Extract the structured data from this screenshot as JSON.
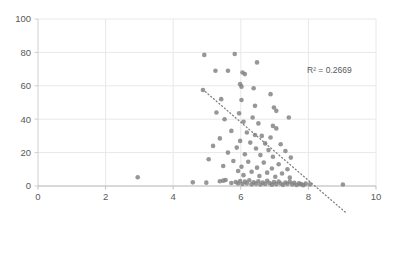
{
  "chart_data": {
    "type": "scatter",
    "title": "",
    "subtitle": "",
    "xlabel": "",
    "ylabel": "",
    "xlim": [
      0,
      10
    ],
    "ylim": [
      0,
      100
    ],
    "xticks": [
      0,
      2,
      4,
      6,
      8,
      10
    ],
    "yticks": [
      0,
      20,
      40,
      60,
      80,
      100
    ],
    "xtick_labels": [
      "0",
      "2",
      "4",
      "6",
      "8",
      "10"
    ],
    "ytick_labels": [
      "0",
      "20",
      "40",
      "60",
      "80",
      "100"
    ],
    "grid": true,
    "grid_color": "#e8e8e8",
    "legend": null,
    "legend_position": "none",
    "marker_color": "#808080",
    "marker_size": 4.6,
    "marker_shape": "circle",
    "annotations": [
      {
        "name": "r-squared-label",
        "text": "R² = 0.2669",
        "x": 8.62,
        "y": 67.5
      }
    ],
    "trendline": {
      "type": "linear-dotted",
      "color": "#808080",
      "x_start": 4.95,
      "y_start": 56.5,
      "x_end": 9.1,
      "y_end": -15.8
    },
    "series": [
      {
        "name": "observations",
        "color": "#808080",
        "points": [
          [
            4.92,
            78.5
          ],
          [
            5.82,
            79.0
          ],
          [
            5.25,
            69.0
          ],
          [
            5.62,
            69.0
          ],
          [
            6.05,
            68.0
          ],
          [
            6.12,
            67.0
          ],
          [
            6.48,
            74.0
          ],
          [
            5.98,
            61.0
          ],
          [
            6.02,
            59.5
          ],
          [
            6.38,
            58.5
          ],
          [
            4.88,
            57.5
          ],
          [
            5.42,
            52.0
          ],
          [
            6.02,
            51.5
          ],
          [
            6.88,
            55.0
          ],
          [
            6.42,
            48.0
          ],
          [
            6.98,
            47.0
          ],
          [
            7.05,
            45.0
          ],
          [
            5.28,
            44.0
          ],
          [
            5.95,
            43.5
          ],
          [
            6.35,
            41.0
          ],
          [
            7.42,
            41.0
          ],
          [
            5.52,
            40.0
          ],
          [
            6.08,
            38.5
          ],
          [
            6.52,
            37.5
          ],
          [
            6.95,
            36.0
          ],
          [
            7.05,
            34.5
          ],
          [
            5.72,
            33.0
          ],
          [
            6.18,
            32.0
          ],
          [
            6.42,
            30.5
          ],
          [
            6.62,
            30.0
          ],
          [
            6.88,
            29.0
          ],
          [
            5.38,
            28.5
          ],
          [
            5.98,
            27.0
          ],
          [
            6.28,
            26.0
          ],
          [
            6.72,
            25.5
          ],
          [
            7.18,
            25.0
          ],
          [
            5.18,
            24.0
          ],
          [
            5.88,
            23.0
          ],
          [
            6.45,
            22.5
          ],
          [
            6.82,
            21.5
          ],
          [
            7.32,
            21.0
          ],
          [
            5.62,
            20.0
          ],
          [
            6.12,
            19.0
          ],
          [
            6.58,
            18.5
          ],
          [
            6.95,
            17.5
          ],
          [
            7.48,
            17.0
          ],
          [
            5.05,
            16.0
          ],
          [
            5.78,
            15.0
          ],
          [
            6.22,
            14.5
          ],
          [
            6.68,
            14.0
          ],
          [
            7.12,
            13.0
          ],
          [
            5.48,
            12.0
          ],
          [
            6.02,
            11.5
          ],
          [
            6.48,
            11.0
          ],
          [
            6.92,
            10.5
          ],
          [
            7.38,
            10.0
          ],
          [
            5.92,
            9.0
          ],
          [
            6.32,
            8.5
          ],
          [
            6.78,
            8.0
          ],
          [
            7.22,
            7.5
          ],
          [
            6.08,
            6.5
          ],
          [
            6.55,
            6.0
          ],
          [
            7.02,
            5.5
          ],
          [
            7.45,
            5.0
          ],
          [
            2.95,
            5.2
          ],
          [
            4.58,
            2.2
          ],
          [
            4.98,
            2.0
          ],
          [
            5.38,
            2.8
          ],
          [
            5.48,
            3.2
          ],
          [
            5.55,
            3.6
          ],
          [
            5.72,
            1.8
          ],
          [
            5.85,
            2.4
          ],
          [
            5.92,
            1.5
          ],
          [
            5.98,
            3.0
          ],
          [
            6.05,
            1.2
          ],
          [
            6.12,
            2.6
          ],
          [
            6.18,
            1.6
          ],
          [
            6.25,
            3.4
          ],
          [
            6.32,
            1.0
          ],
          [
            6.38,
            2.2
          ],
          [
            6.45,
            1.4
          ],
          [
            6.52,
            2.8
          ],
          [
            6.58,
            0.9
          ],
          [
            6.65,
            2.0
          ],
          [
            6.72,
            1.2
          ],
          [
            6.78,
            3.1
          ],
          [
            6.85,
            1.7
          ],
          [
            6.92,
            0.8
          ],
          [
            6.98,
            2.3
          ],
          [
            7.05,
            1.1
          ],
          [
            7.12,
            2.7
          ],
          [
            7.18,
            1.5
          ],
          [
            7.25,
            0.7
          ],
          [
            7.32,
            2.1
          ],
          [
            7.38,
            1.3
          ],
          [
            7.45,
            2.5
          ],
          [
            7.52,
            1.0
          ],
          [
            7.58,
            1.9
          ],
          [
            7.65,
            0.6
          ],
          [
            7.72,
            1.6
          ],
          [
            7.78,
            1.1
          ],
          [
            7.85,
            0.5
          ],
          [
            7.92,
            1.4
          ],
          [
            8.05,
            1.0
          ],
          [
            9.02,
            0.9
          ]
        ]
      }
    ]
  }
}
